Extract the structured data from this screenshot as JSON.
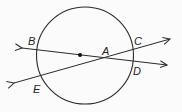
{
  "diagram": {
    "circle": {
      "cx": 85,
      "cy": 55.5,
      "r": 48.5,
      "stroke": "#2a2a2a"
    },
    "center_dot": {
      "cx": 80,
      "cy": 55,
      "r": 2
    },
    "lines": [
      {
        "name": "line-BD",
        "x1": 22,
        "y1": 48,
        "x2": 167,
        "y2": 65
      },
      {
        "name": "line-EC",
        "x1": 14,
        "y1": 83,
        "x2": 170,
        "y2": 39
      }
    ],
    "labels": [
      {
        "id": "B",
        "text": "B",
        "x": 28,
        "y": 45
      },
      {
        "id": "A",
        "text": "A",
        "x": 102,
        "y": 55
      },
      {
        "id": "C",
        "text": "C",
        "x": 134,
        "y": 45
      },
      {
        "id": "D",
        "text": "D",
        "x": 133,
        "y": 75
      },
      {
        "id": "E",
        "text": "E",
        "x": 33,
        "y": 93
      }
    ]
  }
}
